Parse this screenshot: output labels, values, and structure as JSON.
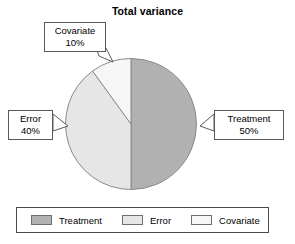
{
  "chart_data": {
    "type": "pie",
    "title": "Total variance",
    "categories": [
      "Treatment",
      "Error",
      "Covariate"
    ],
    "values": [
      50,
      40,
      10
    ],
    "value_suffix": "%",
    "colors": [
      "#b1b1b1",
      "#e6e6e6",
      "#f6f6f6"
    ],
    "stroke_color": "#8a8a8a",
    "start_angle_deg": 0,
    "direction": "clockwise",
    "legend_position": "bottom",
    "grid": false,
    "annotations": [
      {
        "label": "Covariate",
        "value": "10%",
        "slice": "Covariate"
      },
      {
        "label": "Error",
        "value": "40%",
        "slice": "Error"
      },
      {
        "label": "Treatment",
        "value": "50%",
        "slice": "Treatment"
      }
    ]
  },
  "title": {
    "text": "Total variance"
  },
  "callouts": {
    "covariate": {
      "name": "Covariate",
      "value": "10%"
    },
    "error": {
      "name": "Error",
      "value": "40%"
    },
    "treatment": {
      "name": "Treatment",
      "value": "50%"
    }
  },
  "legend": {
    "items": [
      {
        "label": "Treatment",
        "color": "#b1b1b1"
      },
      {
        "label": "Error",
        "color": "#e6e6e6"
      },
      {
        "label": "Covariate",
        "color": "#f6f6f6"
      }
    ]
  }
}
